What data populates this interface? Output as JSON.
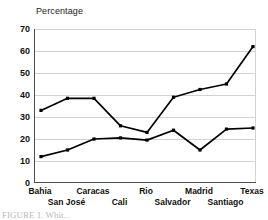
{
  "chart_data": {
    "type": "line",
    "title": "Percentage",
    "xlabel": "",
    "ylabel": "Percentage",
    "ylim": [
      0,
      70
    ],
    "yticks": [
      0,
      10,
      20,
      30,
      40,
      50,
      60,
      70
    ],
    "grid": true,
    "legend": "none",
    "categories": [
      "Bahia",
      "San José",
      "Caracas",
      "Cali",
      "Rio",
      "Salvador",
      "Madrid",
      "Santiago",
      "Texas"
    ],
    "series": [
      {
        "name": "series-1",
        "marker": "square",
        "color": "#000000",
        "values": [
          33,
          38.5,
          38.5,
          26,
          23,
          39,
          42.5,
          45,
          62
        ]
      },
      {
        "name": "series-2",
        "marker": "square",
        "color": "#000000",
        "values": [
          12,
          15,
          20,
          20.5,
          19.5,
          24,
          15,
          24.5,
          25
        ]
      }
    ]
  },
  "axis": {
    "title": "Percentage",
    "ytick_labels": [
      "70",
      "60",
      "50",
      "40",
      "30",
      "20",
      "10",
      "0"
    ],
    "xtick_labels": [
      "Bahia",
      "San José",
      "Caracas",
      "Cali",
      "Rio",
      "Salvador",
      "Madrid",
      "Santiago",
      "Texas"
    ]
  },
  "caption": {
    "text": "FIGURE 1.  Whit..."
  }
}
